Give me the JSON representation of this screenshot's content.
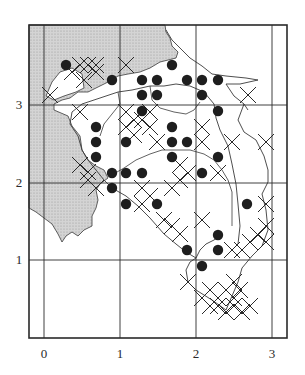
{
  "map": {
    "frame": {
      "left": 29,
      "top": 25,
      "right": 287,
      "bottom": 338
    },
    "grid": {
      "vertical": [
        {
          "value": 0,
          "px": 44
        },
        {
          "value": 1,
          "px": 120
        },
        {
          "value": 2,
          "px": 196
        },
        {
          "value": 3,
          "px": 272
        }
      ],
      "horizontal": [
        {
          "value": 3,
          "px": 105
        },
        {
          "value": 2,
          "px": 183
        },
        {
          "value": 1,
          "px": 260
        }
      ]
    },
    "x_axis": {
      "ticks": [
        "0",
        "1",
        "2",
        "3"
      ]
    },
    "y_axis": {
      "ticks": [
        "3",
        "2",
        "1"
      ]
    },
    "colors": {
      "land_shading": "#c8c8c8",
      "line": "#2a2a2a",
      "dot": "#1e1e1e"
    },
    "legend_symbols": {
      "dot": "filled circle record",
      "cross": "cross record"
    },
    "dots": [
      [
        66,
        65
      ],
      [
        112,
        80
      ],
      [
        142,
        80
      ],
      [
        157,
        80
      ],
      [
        172,
        65
      ],
      [
        187,
        80
      ],
      [
        202,
        80
      ],
      [
        218,
        80
      ],
      [
        142,
        95
      ],
      [
        157,
        95
      ],
      [
        202,
        95
      ],
      [
        142,
        111
      ],
      [
        218,
        111
      ],
      [
        96,
        127
      ],
      [
        172,
        127
      ],
      [
        96,
        142
      ],
      [
        126,
        142
      ],
      [
        172,
        142
      ],
      [
        187,
        142
      ],
      [
        96,
        157
      ],
      [
        172,
        157
      ],
      [
        218,
        157
      ],
      [
        112,
        173
      ],
      [
        126,
        173
      ],
      [
        142,
        173
      ],
      [
        202,
        173
      ],
      [
        112,
        188
      ],
      [
        126,
        204
      ],
      [
        157,
        204
      ],
      [
        247,
        204
      ],
      [
        218,
        235
      ],
      [
        187,
        250
      ],
      [
        218,
        250
      ],
      [
        202,
        266
      ]
    ],
    "crosses": [
      [
        80,
        65
      ],
      [
        88,
        65
      ],
      [
        96,
        65
      ],
      [
        72,
        72
      ],
      [
        84,
        80
      ],
      [
        96,
        72
      ],
      [
        126,
        65
      ],
      [
        50,
        95
      ],
      [
        80,
        112
      ],
      [
        126,
        112
      ],
      [
        134,
        120
      ],
      [
        142,
        120
      ],
      [
        150,
        112
      ],
      [
        126,
        127
      ],
      [
        134,
        135
      ],
      [
        150,
        127
      ],
      [
        157,
        142
      ],
      [
        202,
        127
      ],
      [
        202,
        142
      ],
      [
        232,
        142
      ],
      [
        266,
        142
      ],
      [
        248,
        95
      ],
      [
        80,
        165
      ],
      [
        88,
        172
      ],
      [
        88,
        180
      ],
      [
        96,
        188
      ],
      [
        142,
        188
      ],
      [
        150,
        196
      ],
      [
        142,
        204
      ],
      [
        172,
        188
      ],
      [
        180,
        165
      ],
      [
        188,
        173
      ],
      [
        180,
        180
      ],
      [
        218,
        173
      ],
      [
        164,
        220
      ],
      [
        172,
        226
      ],
      [
        180,
        234
      ],
      [
        202,
        220
      ],
      [
        266,
        204
      ],
      [
        266,
        226
      ],
      [
        258,
        235
      ],
      [
        250,
        242
      ],
      [
        242,
        250
      ],
      [
        266,
        242
      ],
      [
        232,
        250
      ],
      [
        188,
        282
      ],
      [
        202,
        298
      ],
      [
        210,
        290
      ],
      [
        218,
        298
      ],
      [
        226,
        290
      ],
      [
        234,
        298
      ],
      [
        240,
        290
      ],
      [
        218,
        306
      ],
      [
        226,
        312
      ],
      [
        234,
        306
      ],
      [
        242,
        312
      ],
      [
        250,
        306
      ],
      [
        210,
        306
      ],
      [
        234,
        282
      ]
    ],
    "shaded_region_path": "M29,25 L165,25 L166,32 L170,38 L172,46 L178,52 L176,58 L168,60 L160,62 L150,68 L140,72 L128,74 L118,76 L108,82 L96,88 L88,92 L78,92 L70,98 L62,100 L54,104 L54,110 L68,116 L72,126 L80,136 L82,150 L88,160 L96,166 L104,170 L108,178 L100,184 L96,190 L98,200 L96,208 L92,216 L92,226 L84,230 L78,236 L72,232 L66,236 L62,242 L58,234 L52,224 L44,218 L36,212 L29,208 Z",
    "inner_white_path": "M52,82 L60,72 L72,68 L82,74 L84,88 L76,92 L64,96 L54,100 L46,96 Z",
    "region_outline_path": "M166,30 L172,40 L180,48 L190,58 L202,66 L212,74 L226,76 L246,78 L258,80 L240,84 L226,84 L234,96 L244,104 L248,110 M244,104 L238,120 L244,132 L256,140 L264,156 L268,170 L268,182 L262,194 L266,210 L268,230 L262,246 L252,256 L242,268 L238,282 L232,296 L226,310 M226,310 L212,300 L196,290 L188,282 L186,270 L190,262 L196,258 L200,250 L206,244 L214,240 L220,236 M196,258 L186,252 L176,244 L164,234 L150,218 L138,206 L126,196 L112,188 L104,180 L96,170 L88,160 L82,150 L78,136 L70,124 L72,112 L82,104 L94,100 L106,96 L118,92 L132,90 L150,86 L164,86 L176,84 L190,86 L204,92 L214,104 L216,118 L220,130 L228,146 L232,164 L236,184 L238,204 L240,226 L238,244",
    "inner_lines_path": "M110,176 L124,168 L136,160 L150,154 L162,150 L176,150 L190,150 L204,154 L214,160 L222,170 L228,180 L232,192 L232,210 L232,226 M150,86 L152,100 L160,108 L174,112 L186,114 L194,110 L200,102 M118,92 L120,104 L112,114 L104,124 L100,136"
  }
}
